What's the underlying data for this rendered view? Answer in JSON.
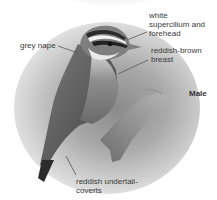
{
  "figure": {
    "sex_label": "Male",
    "annotations": [
      {
        "id": "supercilium",
        "lines": [
          "white",
          "supercilium and",
          "forehead"
        ]
      },
      {
        "id": "nape",
        "lines": [
          "grey nape"
        ]
      },
      {
        "id": "breast",
        "lines": [
          "reddish-brown",
          "breast"
        ]
      },
      {
        "id": "undertail",
        "lines": [
          "reddish undertail-",
          "coverts"
        ]
      }
    ]
  },
  "colors": {
    "label_text": "#3a3a3a",
    "leader_line": "#555555",
    "background": "#ffffff"
  }
}
